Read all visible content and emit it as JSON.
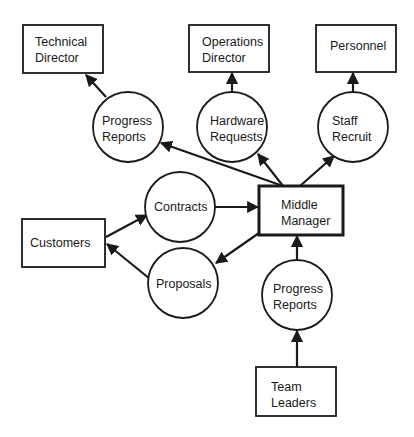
{
  "diagram": {
    "type": "data-flow-diagram",
    "colors": {
      "stroke": "#1a1a1a",
      "background": "#ffffff"
    },
    "entities": [
      {
        "id": "technical_director",
        "lines": [
          "Technical",
          "Director"
        ]
      },
      {
        "id": "operations_director",
        "lines": [
          "Operations",
          "Director"
        ]
      },
      {
        "id": "personnel",
        "lines": [
          "Personnel"
        ]
      },
      {
        "id": "customers",
        "lines": [
          "Customers"
        ]
      },
      {
        "id": "middle_manager",
        "lines": [
          "Middle",
          "Manager"
        ]
      },
      {
        "id": "team_leaders",
        "lines": [
          "Team",
          "Leaders"
        ]
      }
    ],
    "processes": [
      {
        "id": "progress_reports_top",
        "lines": [
          "Progress",
          "Reports"
        ]
      },
      {
        "id": "hardware_requests",
        "lines": [
          "Hardware",
          "Requests"
        ]
      },
      {
        "id": "staff_recruit",
        "lines": [
          "Staff",
          "Recruit"
        ]
      },
      {
        "id": "contracts",
        "lines": [
          "Contracts"
        ]
      },
      {
        "id": "proposals",
        "lines": [
          "Proposals"
        ]
      },
      {
        "id": "progress_reports_bottom",
        "lines": [
          "Progress",
          "Reports"
        ]
      }
    ],
    "flows": [
      {
        "from": "middle_manager",
        "to": "progress_reports_top"
      },
      {
        "from": "progress_reports_top",
        "to": "technical_director"
      },
      {
        "from": "middle_manager",
        "to": "hardware_requests"
      },
      {
        "from": "hardware_requests",
        "to": "operations_director"
      },
      {
        "from": "middle_manager",
        "to": "staff_recruit"
      },
      {
        "from": "staff_recruit",
        "to": "personnel"
      },
      {
        "from": "customers",
        "to": "contracts"
      },
      {
        "from": "contracts",
        "to": "middle_manager"
      },
      {
        "from": "middle_manager",
        "to": "proposals"
      },
      {
        "from": "proposals",
        "to": "customers"
      },
      {
        "from": "team_leaders",
        "to": "progress_reports_bottom"
      },
      {
        "from": "progress_reports_bottom",
        "to": "middle_manager"
      }
    ]
  }
}
